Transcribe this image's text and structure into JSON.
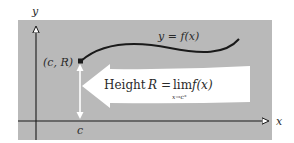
{
  "diagram": {
    "type": "one-sided limit illustration",
    "colors": {
      "background": "#ffffff",
      "panel": "#b9b9b9",
      "curve": "#1a1a1a",
      "axes": "#1a1a1a",
      "arrow_fill": "#ffffff"
    },
    "axes": {
      "y_label": "y",
      "x_label": "x"
    },
    "curve": {
      "label": "y = f(x)"
    },
    "point": {
      "label": "(c, R)"
    },
    "x_tick": {
      "label": "c"
    },
    "annotation": {
      "prefix": "Height",
      "var": "R",
      "equals": "=",
      "lim": "lim",
      "lim_sub": "x→c⁺",
      "func": "f(x)"
    }
  }
}
